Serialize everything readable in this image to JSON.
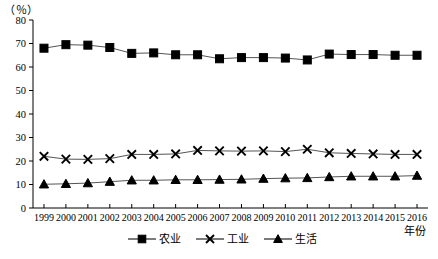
{
  "chart_data": {
    "type": "line",
    "title": "",
    "subtitle": "",
    "unit_label": "（％）",
    "xlabel": "年份",
    "ylabel": "",
    "ylim": [
      0,
      80
    ],
    "ytick_step": 10,
    "yticks": [
      "0",
      "10",
      "20",
      "30",
      "40",
      "50",
      "60",
      "70",
      "80"
    ],
    "grid": false,
    "legend_position": "bottom",
    "categories": [
      "1999",
      "2000",
      "2001",
      "2002",
      "2003",
      "2004",
      "2005",
      "2006",
      "2007",
      "2008",
      "2009",
      "2010",
      "2011",
      "2012",
      "2013",
      "2014",
      "2015",
      "2016"
    ],
    "series": [
      {
        "name": "农业",
        "marker": "square",
        "color": "#000000",
        "values": [
          68.0,
          69.5,
          69.3,
          68.3,
          65.8,
          66.0,
          65.2,
          65.2,
          63.5,
          64.0,
          64.0,
          63.8,
          63.0,
          65.5,
          65.3,
          65.3,
          65.0,
          65.0
        ]
      },
      {
        "name": "工业",
        "marker": "cross",
        "color": "#000000",
        "values": [
          22.0,
          20.8,
          20.7,
          21.0,
          22.8,
          22.8,
          23.0,
          24.5,
          24.3,
          24.2,
          24.3,
          24.0,
          25.0,
          23.5,
          23.2,
          23.0,
          22.8,
          22.8
        ]
      },
      {
        "name": "生活",
        "marker": "triangle",
        "color": "#000000",
        "values": [
          10.1,
          10.3,
          10.6,
          11.2,
          11.8,
          11.8,
          12.0,
          12.0,
          12.1,
          12.2,
          12.5,
          12.7,
          12.8,
          13.2,
          13.5,
          13.5,
          13.5,
          13.8
        ]
      }
    ]
  },
  "legend": {
    "items": [
      {
        "label": "农业",
        "marker": "square"
      },
      {
        "label": "工业",
        "marker": "cross"
      },
      {
        "label": "生活",
        "marker": "triangle"
      }
    ]
  }
}
